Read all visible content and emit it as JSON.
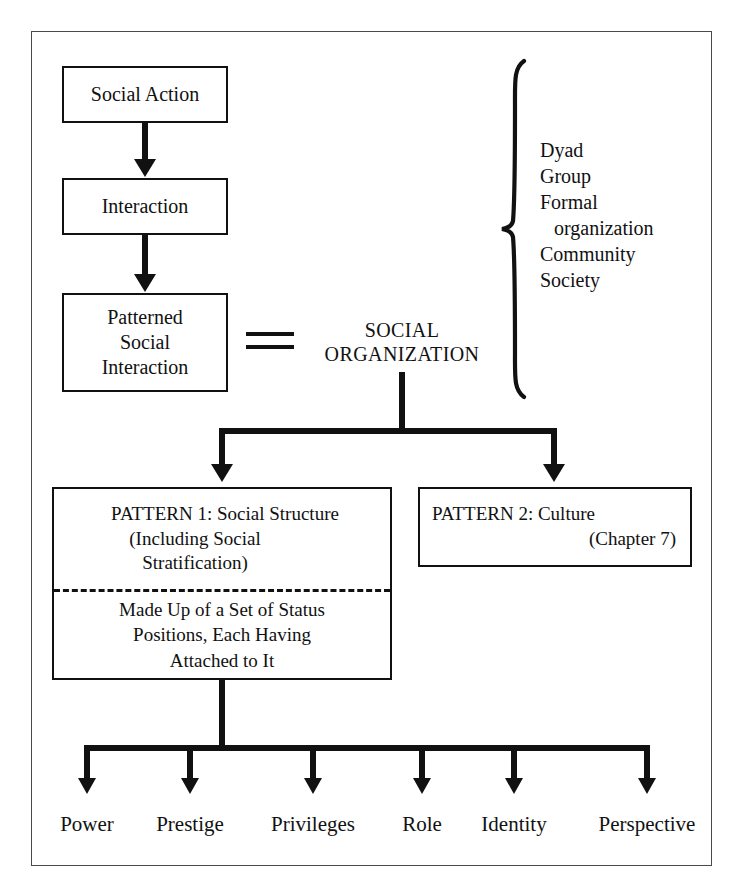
{
  "diagram": {
    "chain": [
      {
        "label": "Social Action"
      },
      {
        "label": "Interaction"
      },
      {
        "label_line1": "Patterned",
        "label_line2": "Social",
        "label_line3": "Interaction"
      }
    ],
    "equals_symbol": "=",
    "social_organization": {
      "line1": "SOCIAL",
      "line2": "ORGANIZATION"
    },
    "brace_list": [
      "Dyad",
      "Group",
      "Formal",
      "organization",
      "Community",
      "Society"
    ],
    "pattern1": {
      "line1": "PATTERN 1: Social Structure",
      "line2": "(Including Social",
      "line3": "Stratification)",
      "sub_line1": "Made Up of a Set of Status",
      "sub_line2": "Positions, Each Having",
      "sub_line3": "Attached to It"
    },
    "pattern2": {
      "line1": "PATTERN 2: Culture",
      "line2": "(Chapter 7)"
    },
    "terms": [
      "Power",
      "Prestige",
      "Privileges",
      "Role",
      "Identity",
      "Perspective"
    ],
    "colors": {
      "ink": "#111111",
      "frame": "#4a4a4a",
      "paper": "#ffffff"
    }
  }
}
